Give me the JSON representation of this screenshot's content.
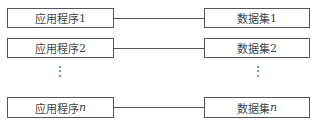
{
  "diagram": {
    "rows": [
      {
        "app": "应用程序",
        "app_suffix": "1",
        "dataset": "数据集",
        "dataset_suffix": "1"
      },
      {
        "app": "应用程序",
        "app_suffix": "2",
        "dataset": "数据集",
        "dataset_suffix": "2"
      },
      {
        "app": "应用程序",
        "app_suffix": "n",
        "dataset": "数据集",
        "dataset_suffix": "n"
      }
    ],
    "ellipsis": "⋮"
  }
}
